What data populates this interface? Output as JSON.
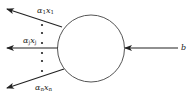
{
  "diagram": {
    "node": {
      "shape": "circle",
      "cx": 91,
      "cy": 48.5,
      "r": 33.5,
      "stroke": "#555555"
    },
    "outgoing_arrows": [
      {
        "label_base1": "α",
        "label_sub1": "1",
        "label_base2": "x",
        "label_sub2": "1"
      },
      {
        "label_base1": "α",
        "label_sub1": "j",
        "label_base2": "x",
        "label_sub2": "j"
      },
      {
        "label_base1": "α",
        "label_sub1": "n",
        "label_base2": "x",
        "label_sub2": "n"
      }
    ],
    "incoming_arrow": {
      "label": "b"
    },
    "ellipsis": "vertical dots"
  }
}
